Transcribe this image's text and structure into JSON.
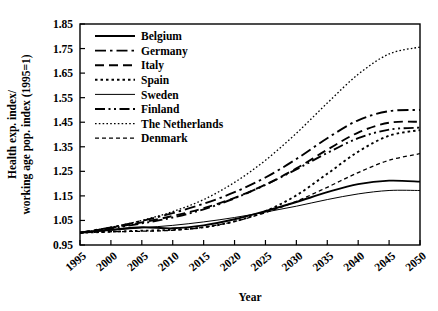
{
  "chart_data": {
    "type": "line",
    "title": "",
    "xlabel": "Year",
    "ylabel": "Health exp. index/\nworking age pop. index (1995=1)",
    "ylabel_line1": "Health exp. index/",
    "ylabel_line2": "working age pop. index (1995=1)",
    "xlim": [
      1995,
      2050
    ],
    "ylim": [
      0.95,
      1.85
    ],
    "grid": false,
    "legend_position": "top-left-inside",
    "xticks": [
      1995,
      2000,
      2005,
      2010,
      2015,
      2020,
      2025,
      2030,
      2035,
      2040,
      2045,
      2050
    ],
    "xtick_labels": [
      "1995",
      "2000",
      "2005",
      "2010",
      "2015",
      "2020",
      "2025",
      "2030",
      "2035",
      "2040",
      "2045",
      "2050"
    ],
    "yticks": [
      0.95,
      1.05,
      1.15,
      1.25,
      1.35,
      1.45,
      1.55,
      1.65,
      1.75,
      1.85
    ],
    "ytick_labels": [
      "0.95",
      "1.05",
      "1.15",
      "1.25",
      "1.35",
      "1.45",
      "1.55",
      "1.65",
      "1.75",
      "1.85"
    ],
    "x": [
      1995,
      2000,
      2005,
      2010,
      2015,
      2020,
      2025,
      2030,
      2035,
      2040,
      2045,
      2050
    ],
    "series": [
      {
        "name": "Belgium",
        "style": "solid",
        "width": 1.9,
        "dash": "",
        "values": [
          1.0,
          1.012,
          1.022,
          1.018,
          1.03,
          1.055,
          1.088,
          1.125,
          1.165,
          1.198,
          1.212,
          1.208
        ]
      },
      {
        "name": "Germany",
        "style": "dash-dot",
        "width": 1.9,
        "dash": "11,4,2.5,4",
        "values": [
          1.0,
          1.022,
          1.048,
          1.08,
          1.118,
          1.165,
          1.225,
          1.3,
          1.385,
          1.458,
          1.495,
          1.5
        ]
      },
      {
        "name": "Italy",
        "style": "dashed",
        "width": 1.9,
        "dash": "9,5",
        "values": [
          1.0,
          1.02,
          1.042,
          1.068,
          1.1,
          1.142,
          1.196,
          1.262,
          1.338,
          1.408,
          1.448,
          1.452
        ]
      },
      {
        "name": "Spain",
        "style": "dotted",
        "width": 1.9,
        "dash": "2.5,3",
        "values": [
          1.0,
          1.004,
          1.008,
          1.012,
          1.022,
          1.046,
          1.088,
          1.152,
          1.24,
          1.33,
          1.395,
          1.418
        ]
      },
      {
        "name": "Sweden",
        "style": "solid-thin",
        "width": 1.0,
        "dash": "",
        "values": [
          1.0,
          1.01,
          1.02,
          1.03,
          1.044,
          1.062,
          1.084,
          1.108,
          1.135,
          1.158,
          1.172,
          1.172
        ]
      },
      {
        "name": "Finland",
        "style": "dash-dot-dot",
        "width": 1.9,
        "dash": "10,3.5,2,3.5,2,3.5",
        "values": [
          1.0,
          1.018,
          1.038,
          1.062,
          1.095,
          1.14,
          1.195,
          1.258,
          1.325,
          1.385,
          1.42,
          1.428
        ]
      },
      {
        "name": "The Netherlands",
        "style": "fine-dotted",
        "width": 1.3,
        "dash": "1.6,2.2",
        "values": [
          1.0,
          1.022,
          1.05,
          1.086,
          1.135,
          1.205,
          1.295,
          1.405,
          1.528,
          1.645,
          1.728,
          1.756
        ]
      },
      {
        "name": "Denmark",
        "style": "short-dashed",
        "width": 1.3,
        "dash": "4,3",
        "values": [
          1.0,
          1.004,
          1.006,
          1.01,
          1.022,
          1.046,
          1.082,
          1.128,
          1.185,
          1.245,
          1.295,
          1.322
        ]
      }
    ]
  },
  "legend": {
    "items": [
      {
        "label": "Belgium"
      },
      {
        "label": "Germany"
      },
      {
        "label": "Italy"
      },
      {
        "label": "Spain"
      },
      {
        "label": "Sweden"
      },
      {
        "label": "Finland"
      },
      {
        "label": "The Netherlands"
      },
      {
        "label": "Denmark"
      }
    ]
  },
  "colors": {
    "line": "#000000",
    "axis": "#000000",
    "background": "#ffffff"
  }
}
